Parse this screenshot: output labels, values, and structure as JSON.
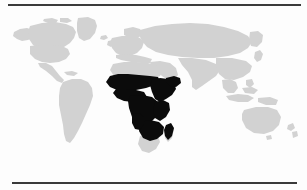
{
  "figure": {
    "type": "world-map",
    "projection": "equirectangular",
    "has_text_labels": false,
    "background_color": "#fdfdfd",
    "rules": {
      "top": {
        "color": "#3a3a3a"
      },
      "bottom": {
        "color": "#3a3a3a"
      }
    }
  },
  "map": {
    "base_region_color": "#d2d2d2",
    "highlight_region_color": "#0b0b0b",
    "ocean_color": "#fdfdfd",
    "highlighted_region_name": "Sub-Saharan Africa",
    "base_regions": [
      "North America",
      "Greenland",
      "South America",
      "Europe",
      "North Africa",
      "Southern Africa",
      "Asia",
      "Southeast Asia",
      "Australia",
      "New Zealand"
    ],
    "highlighted_regions": [
      "West Africa",
      "Central Africa",
      "East Africa",
      "Horn of Africa",
      "Southern Central Africa",
      "Madagascar"
    ]
  }
}
